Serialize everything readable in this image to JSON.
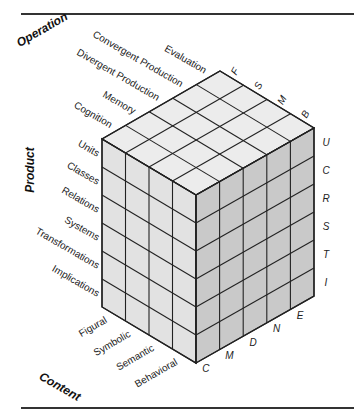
{
  "axes": {
    "operation": {
      "title": "Operation",
      "items": [
        "Evaluation",
        "Convergent Production",
        "Divergent Production",
        "Memory",
        "Cognition"
      ],
      "codes": [
        "E",
        "N",
        "D",
        "M",
        "C"
      ]
    },
    "product": {
      "title": "Product",
      "items": [
        "Units",
        "Classes",
        "Relations",
        "Systems",
        "Transformations",
        "Implications"
      ],
      "codes": [
        "U",
        "C",
        "R",
        "S",
        "T",
        "I"
      ]
    },
    "content": {
      "title": "Content",
      "items": [
        "Figural",
        "Symbolic",
        "Semantic",
        "Behavioral"
      ],
      "codes": [
        "F",
        "S",
        "M",
        "B"
      ]
    }
  },
  "colors": {
    "top": "#ececec",
    "left": "#e2e2e2",
    "right": "#c9c9c9",
    "line": "#222222"
  }
}
